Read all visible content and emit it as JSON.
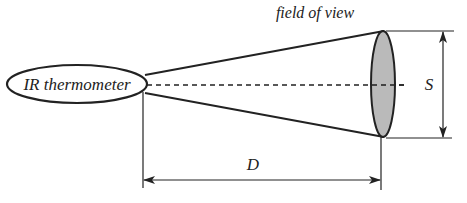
{
  "diagram": {
    "device_label": "IR thermometer",
    "fov_label": "field of view",
    "spot_size_label": "S",
    "distance_label": "D"
  },
  "colors": {
    "stroke": "#222222",
    "fov_fill": "#b3b3b3",
    "background": "#ffffff"
  }
}
